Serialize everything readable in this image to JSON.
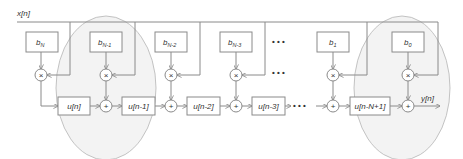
{
  "diagram": {
    "input_label": "x[n]",
    "output_label": "y[n]",
    "coefficients": [
      {
        "id": "bN",
        "base": "b",
        "sub": "N"
      },
      {
        "id": "bN-1",
        "base": "b",
        "sub": "N-1"
      },
      {
        "id": "bN-2",
        "base": "b",
        "sub": "N-2"
      },
      {
        "id": "bN-3",
        "base": "b",
        "sub": "N-3"
      },
      {
        "id": "b1",
        "base": "b",
        "sub": "1"
      },
      {
        "id": "b0",
        "base": "b",
        "sub": "0"
      }
    ],
    "delays": [
      "u[n]",
      "u[n-1]",
      "u[n-2]",
      "u[n-3]",
      "u[n-N+1]"
    ],
    "multiply_symbol": "×",
    "add_symbol": "+",
    "ellipsis": "• • •",
    "colors": {
      "line": "#8a8a8a",
      "box_fill": "#ffffff",
      "box_stroke": "#8a8a8a",
      "ellipse_fill": "#f3f3f3",
      "ellipse_stroke": "#b5b5b5",
      "text": "#333333"
    }
  }
}
